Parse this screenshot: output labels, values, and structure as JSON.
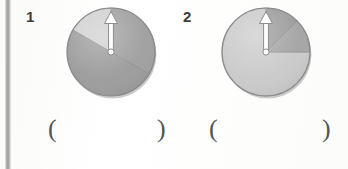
{
  "page": {
    "background_color": "#fdfdfd",
    "width": 348,
    "height": 169
  },
  "margin_rule": {
    "color": "#9a9a9a",
    "label": "left-margin-rule"
  },
  "problems": [
    {
      "number": "1",
      "spinner": {
        "name": "spinner-thirds",
        "center_x": 50,
        "center_y": 48,
        "radius": 44,
        "pointer_angle_deg": 0,
        "pointer_label": "arrow pointing up",
        "sectors": [
          {
            "label": "sector-light-left",
            "start_deg": 240,
            "end_deg": 360,
            "color": "#cfcfcf",
            "fraction": "1/3"
          },
          {
            "label": "sector-dark-right",
            "start_deg": 0,
            "end_deg": 120,
            "color": "#9e9e9e",
            "fraction": "1/3"
          },
          {
            "label": "sector-dark-bottom",
            "start_deg": 120,
            "end_deg": 240,
            "color": "#9a9a9a",
            "fraction": "1/3"
          }
        ]
      },
      "answer": {
        "open_paren": "(",
        "close_paren": ")",
        "value": ""
      }
    },
    {
      "number": "2",
      "spinner": {
        "name": "spinner-quarter-split",
        "center_x": 50,
        "center_y": 48,
        "radius": 44,
        "pointer_angle_deg": 0,
        "pointer_label": "arrow pointing up",
        "sectors": [
          {
            "label": "sector-dark-upper-right",
            "start_deg": 0,
            "end_deg": 45,
            "color": "#9a9a9a",
            "fraction": "1/8"
          },
          {
            "label": "sector-dark-lower-right",
            "start_deg": 45,
            "end_deg": 90,
            "color": "#a3a3a3",
            "fraction": "1/8"
          },
          {
            "label": "sector-light-remainder",
            "start_deg": 90,
            "end_deg": 360,
            "color": "#c9c9c9",
            "fraction": "3/4"
          }
        ]
      },
      "answer": {
        "open_paren": "(",
        "close_paren": ")",
        "value": ""
      }
    }
  ],
  "colors": {
    "light_gray": "#cfcfcf",
    "mid_gray": "#c9c9c9",
    "dark_gray": "#9a9a9a",
    "dark_gray_alt": "#9e9e9e",
    "outline": "#8a8a8a",
    "pointer_fill": "#ffffff",
    "pointer_stroke": "#8d8d8d",
    "text": "#3c3c3c",
    "paren": "#555555",
    "shadow": "rgba(140,140,140,0.45)"
  }
}
